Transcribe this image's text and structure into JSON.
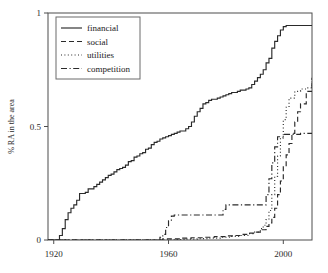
{
  "chart_data": {
    "type": "line",
    "title": "",
    "xlabel": "",
    "ylabel": "% RA in the area",
    "xlim": [
      1918,
      2010
    ],
    "ylim": [
      0,
      1
    ],
    "xticks": [
      1920,
      1960,
      2000
    ],
    "xticklabels": [
      "1920",
      "1960",
      "2000"
    ],
    "yticks": [
      0,
      0.5,
      1
    ],
    "yticklabels": [
      "0",
      "0.5",
      "1"
    ],
    "grid": false,
    "legend_position": "upper-left",
    "legend_entries": [
      {
        "label": "financial",
        "style": "solid",
        "dash": "none"
      },
      {
        "label": "social",
        "style": "dashed",
        "dash": "5,3"
      },
      {
        "label": "utilities",
        "style": "dotted",
        "dash": "1,2.4"
      },
      {
        "label": "competition",
        "style": "dashdot",
        "dash": "6,2.5,1.2,2.5"
      }
    ],
    "series": [
      {
        "name": "financial",
        "style": "solid",
        "dash": "none",
        "x": [
          1918,
          1921,
          1922,
          1923,
          1924,
          1925,
          1926,
          1927,
          1928,
          1929,
          1930,
          1931,
          1932,
          1933,
          1934,
          1935,
          1936,
          1937,
          1938,
          1939,
          1940,
          1941,
          1942,
          1943,
          1944,
          1945,
          1946,
          1947,
          1948,
          1949,
          1950,
          1951,
          1952,
          1953,
          1954,
          1955,
          1956,
          1957,
          1958,
          1959,
          1960,
          1961,
          1962,
          1963,
          1964,
          1965,
          1966,
          1967,
          1968,
          1969,
          1970,
          1971,
          1972,
          1973,
          1974,
          1975,
          1976,
          1977,
          1978,
          1979,
          1980,
          1981,
          1982,
          1983,
          1984,
          1985,
          1986,
          1987,
          1988,
          1989,
          1990,
          1991,
          1992,
          1993,
          1994,
          1995,
          1996,
          1997,
          1998,
          1999,
          2000,
          2001,
          2002,
          2005,
          2010
        ],
        "y": [
          0.0,
          0.0,
          0.02,
          0.05,
          0.09,
          0.12,
          0.14,
          0.155,
          0.175,
          0.205,
          0.205,
          0.21,
          0.225,
          0.225,
          0.235,
          0.245,
          0.255,
          0.265,
          0.275,
          0.285,
          0.29,
          0.3,
          0.31,
          0.315,
          0.32,
          0.33,
          0.345,
          0.35,
          0.365,
          0.37,
          0.38,
          0.385,
          0.4,
          0.405,
          0.42,
          0.43,
          0.435,
          0.445,
          0.45,
          0.455,
          0.46,
          0.465,
          0.47,
          0.475,
          0.48,
          0.48,
          0.49,
          0.5,
          0.52,
          0.545,
          0.565,
          0.58,
          0.6,
          0.605,
          0.615,
          0.62,
          0.62,
          0.625,
          0.63,
          0.635,
          0.64,
          0.645,
          0.65,
          0.65,
          0.655,
          0.66,
          0.66,
          0.665,
          0.67,
          0.685,
          0.7,
          0.715,
          0.73,
          0.75,
          0.78,
          0.8,
          0.845,
          0.875,
          0.9,
          0.925,
          0.94,
          0.945,
          0.945,
          0.945,
          0.945
        ]
      },
      {
        "name": "social",
        "style": "dashed",
        "dash": "5,3",
        "x": [
          1918,
          1955,
          1958,
          1960,
          1964,
          1968,
          1972,
          1976,
          1980,
          1983,
          1986,
          1988,
          1990,
          1992,
          1994,
          1995,
          1996,
          1997,
          1998,
          1999,
          2000,
          2001,
          2002,
          2003,
          2004,
          2005,
          2006,
          2008,
          2010
        ],
        "y": [
          0.0,
          0.0,
          0.005,
          0.005,
          0.008,
          0.01,
          0.012,
          0.015,
          0.018,
          0.02,
          0.025,
          0.03,
          0.035,
          0.045,
          0.06,
          0.075,
          0.1,
          0.14,
          0.2,
          0.26,
          0.325,
          0.375,
          0.425,
          0.47,
          0.52,
          0.565,
          0.6,
          0.655,
          0.715
        ]
      },
      {
        "name": "utilities",
        "style": "dotted",
        "dash": "1,2.4",
        "x": [
          1918,
          1958,
          1962,
          1966,
          1970,
          1974,
          1978,
          1982,
          1985,
          1988,
          1990,
          1992,
          1993,
          1994,
          1995,
          1996,
          1997,
          1998,
          1999,
          2000,
          2001,
          2002,
          2004,
          2006,
          2008,
          2010
        ],
        "y": [
          0.0,
          0.0,
          0.002,
          0.004,
          0.006,
          0.008,
          0.012,
          0.016,
          0.02,
          0.028,
          0.035,
          0.05,
          0.065,
          0.09,
          0.13,
          0.2,
          0.28,
          0.37,
          0.45,
          0.53,
          0.585,
          0.625,
          0.655,
          0.665,
          0.67,
          0.7
        ]
      },
      {
        "name": "competition",
        "style": "dashdot",
        "dash": "6,2.5,1.2,2.5",
        "x": [
          1918,
          1956,
          1957,
          1958,
          1959,
          1960,
          1961,
          1962,
          1963,
          1978,
          1979,
          1980,
          1993,
          1994,
          1995,
          1996,
          1997,
          1998,
          2000,
          2002,
          2004,
          2006,
          2008,
          2010
        ],
        "y": [
          0.0,
          0.0,
          0.012,
          0.025,
          0.055,
          0.085,
          0.105,
          0.11,
          0.11,
          0.11,
          0.135,
          0.155,
          0.155,
          0.2,
          0.27,
          0.34,
          0.41,
          0.455,
          0.465,
          0.465,
          0.465,
          0.47,
          0.47,
          0.47
        ]
      }
    ]
  }
}
